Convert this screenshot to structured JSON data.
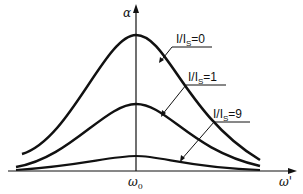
{
  "diagram": {
    "y_axis_label": "α",
    "x_axis_label": "ω'",
    "x_tick_label": "ω",
    "x_tick_subscript": "0",
    "curves": [
      {
        "label_prefix": "I/I",
        "label_subscript": "S",
        "label_suffix": "=0",
        "peak_y": 35
      },
      {
        "label_prefix": "I/I",
        "label_subscript": "S",
        "label_suffix": "=1",
        "peak_y": 104
      },
      {
        "label_prefix": "I/I",
        "label_subscript": "S",
        "label_suffix": "=9",
        "peak_y": 156
      }
    ],
    "line_color": "#111111"
  }
}
